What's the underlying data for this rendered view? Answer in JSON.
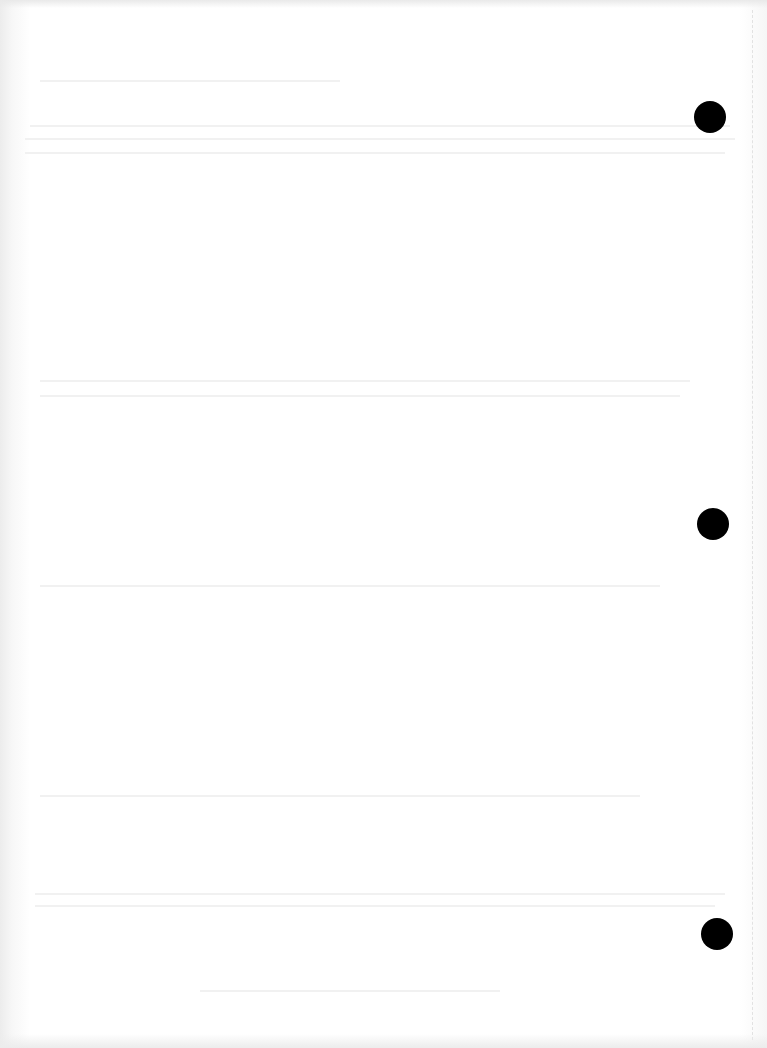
{
  "document": {
    "type": "blank scanned sheet",
    "background_color": "#ffffff",
    "text": ""
  },
  "punch_holes": [
    {
      "cx": 710,
      "cy": 117
    },
    {
      "cx": 713,
      "cy": 524
    },
    {
      "cx": 717,
      "cy": 934
    }
  ],
  "colors": {
    "hole": "#000000",
    "bleed_through": "#f1f1f1",
    "margin_line": "#e2e2e2"
  }
}
